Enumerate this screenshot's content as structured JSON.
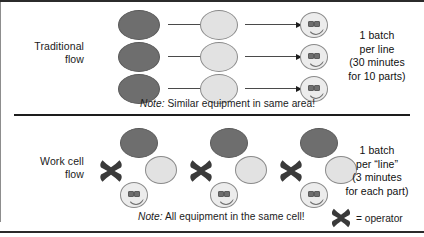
{
  "diagram": {
    "rows": [
      {
        "id": "traditional",
        "label": "Traditional\nflow",
        "label_line1": "Traditional",
        "label_line2": "flow",
        "note_prefix": "Note:",
        "note_text": " Similar equipment in same area!",
        "callout_lines": [
          "1 batch",
          "per line",
          "(30 minutes",
          "for 10 parts)"
        ],
        "stages": [
          {
            "name": "stage-1-machine",
            "shape": "circle",
            "fill": "dark"
          },
          {
            "name": "stage-2-machine",
            "shape": "circle",
            "fill": "light"
          },
          {
            "name": "stage-3-inspection",
            "shape": "smiley",
            "fill": "face"
          }
        ],
        "lines": 3
      },
      {
        "id": "workcell",
        "label": "Work cell\nflow",
        "label_line1": "Work cell",
        "label_line2": "flow",
        "note_prefix": "Note:",
        "note_text": " All equipment in the same cell!",
        "callout_lines": [
          "1 batch",
          "per “line”",
          "(3 minutes",
          "for each part)"
        ],
        "cells": 3,
        "cell_parts": [
          {
            "name": "cell-machine-dark",
            "shape": "circle",
            "fill": "dark"
          },
          {
            "name": "cell-machine-light",
            "shape": "circle",
            "fill": "light"
          },
          {
            "name": "cell-inspection",
            "shape": "smiley",
            "fill": "face"
          },
          {
            "name": "cell-operator",
            "shape": "cross",
            "fill": "operator"
          }
        ]
      }
    ],
    "legend": {
      "symbol_name": "operator-cross-icon",
      "text": "= operator"
    },
    "colors": {
      "dark_node": "#6e6e6e",
      "light_node": "#e2e2e2",
      "face_node": "#ececec",
      "outline": "#8a8a8a",
      "operator": "#3a3a3a",
      "rule": "#2b2b2b",
      "divider": "#8d8d8d",
      "text": "#1b1b1b"
    }
  }
}
